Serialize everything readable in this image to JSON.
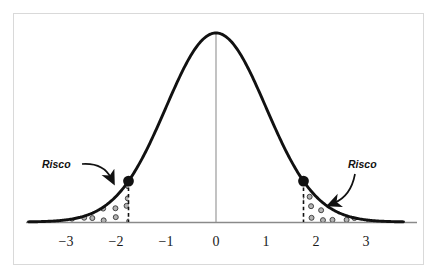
{
  "figure": {
    "title": "",
    "caption_faint": "",
    "annotations": [
      {
        "id": "risco-left",
        "text": "Risco"
      },
      {
        "id": "risco-right",
        "text": "Risco"
      }
    ]
  },
  "colors": {
    "curve": "#111111",
    "axis": "#8a8a8a",
    "center_line": "#9a9a9a",
    "dot_fill": "#111111",
    "tail_dot_fill": "#b3b3b3",
    "tail_dot_stroke": "#3d3d3d",
    "dashed_line": "#111111",
    "frame_border": "#d9d9d9",
    "background": "#ffffff",
    "text": "#1a1a1a"
  },
  "chart_data": {
    "type": "line",
    "title": "",
    "xlabel": "",
    "ylabel": "",
    "xlim": [
      -3.75,
      3.75
    ],
    "ylim": [
      0,
      1.08
    ],
    "grid": false,
    "legend": null,
    "distribution": "standard normal",
    "categories": [],
    "tick_labels": [
      "−3",
      "−2",
      "−1",
      "0",
      "1",
      "2",
      "3"
    ],
    "tick_values": [
      -3,
      -2,
      -1,
      0,
      1,
      2,
      3
    ],
    "series": [
      {
        "name": "normal density",
        "x": [
          -3.75,
          -3.5,
          -3.25,
          -3,
          -2.75,
          -2.5,
          -2.25,
          -2,
          -1.75,
          -1.5,
          -1.25,
          -1,
          -0.75,
          -0.5,
          -0.25,
          0,
          0.25,
          0.5,
          0.75,
          1,
          1.25,
          1.5,
          1.75,
          2,
          2.25,
          2.5,
          2.75,
          3,
          3.25,
          3.5,
          3.75
        ],
        "values": [
          0.0009,
          0.0022,
          0.0051,
          0.0111,
          0.0228,
          0.0439,
          0.0796,
          0.1353,
          0.2163,
          0.3247,
          0.4578,
          0.6065,
          0.7548,
          0.8825,
          0.9692,
          1.0,
          0.9692,
          0.8825,
          0.7548,
          0.6065,
          0.4578,
          0.3247,
          0.2163,
          0.1353,
          0.0796,
          0.0439,
          0.0228,
          0.0111,
          0.0051,
          0.0022,
          0.0009
        ]
      }
    ],
    "markers": [
      {
        "name": "left-critical-point",
        "x": -1.75,
        "y": 0.2163
      },
      {
        "name": "right-critical-point",
        "x": 1.75,
        "y": 0.2163
      }
    ],
    "shaded_regions": [
      {
        "name": "left-tail-risk",
        "from": -3.75,
        "to": -1.75,
        "label": "Risco",
        "fill": "dotted"
      },
      {
        "name": "right-tail-risk",
        "from": 1.75,
        "to": 3.75,
        "label": "Risco",
        "fill": "dotted"
      }
    ],
    "reference_lines": [
      {
        "name": "center-line",
        "x": 0,
        "style": "solid"
      },
      {
        "name": "left-cutoff",
        "x": -1.75,
        "style": "dashed"
      },
      {
        "name": "right-cutoff",
        "x": 1.75,
        "style": "dashed"
      }
    ]
  }
}
